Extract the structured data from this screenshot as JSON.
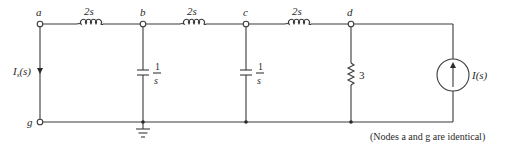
{
  "diagram": {
    "type": "circuit",
    "nodes": {
      "a": "a",
      "b": "b",
      "c": "c",
      "d": "d",
      "g": "g"
    },
    "components": {
      "inductor_ab": {
        "label": "2s",
        "kind": "inductor",
        "between": [
          "a",
          "b"
        ]
      },
      "inductor_bc": {
        "label": "2s",
        "kind": "inductor",
        "between": [
          "b",
          "c"
        ]
      },
      "inductor_cd": {
        "label": "2s",
        "kind": "inductor",
        "between": [
          "c",
          "d"
        ]
      },
      "capacitor_b": {
        "label_num": "1",
        "label_den": "s",
        "kind": "capacitor",
        "between": [
          "b",
          "ground"
        ]
      },
      "capacitor_c": {
        "label_num": "1",
        "label_den": "s",
        "kind": "capacitor",
        "between": [
          "c",
          "ground"
        ]
      },
      "resistor_d": {
        "label": "3",
        "kind": "resistor",
        "between": [
          "d",
          "ground"
        ]
      },
      "current_source": {
        "label": "I(s)",
        "kind": "current-source",
        "direction": "up"
      },
      "short_ag": {
        "label_main": "I",
        "label_sub": "s",
        "label_tail": "(s)",
        "kind": "short-circuit-current",
        "direction": "down"
      }
    },
    "note": "(Nodes a and g are identical)"
  }
}
